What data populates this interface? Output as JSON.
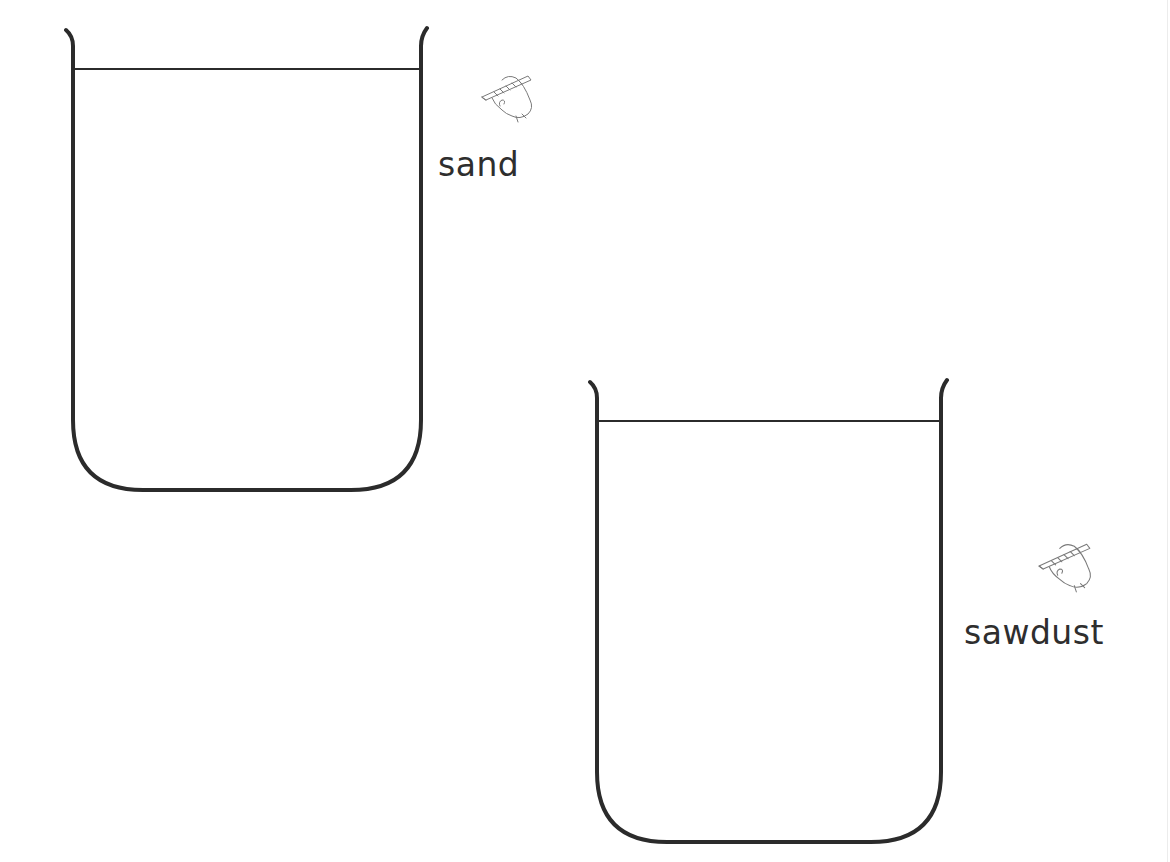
{
  "worksheet": {
    "beakers": [
      {
        "id": "beaker-1",
        "label": "sand",
        "icon": "pencil-hand-icon"
      },
      {
        "id": "beaker-2",
        "label": "sawdust",
        "icon": "pencil-hand-icon"
      }
    ],
    "colors": {
      "outline": "#2b2b2b",
      "text": "#2e2e2e",
      "background": "#ffffff"
    }
  }
}
